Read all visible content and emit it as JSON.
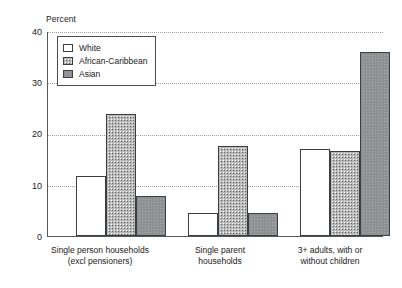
{
  "chart_data": {
    "type": "bar",
    "title": "",
    "subtitle": "",
    "xlabel": "",
    "ylabel": "Percent",
    "ylim": [
      0,
      40
    ],
    "yticks": [
      0,
      10,
      20,
      30,
      40
    ],
    "grid": "horizontal dotted gridlines at 10, 20, 30, 40",
    "legend_position": "inside top-left",
    "categories": [
      "Single person households (excl pensioners)",
      "Single parent households",
      "3+ adults, with or without children"
    ],
    "category_lines": [
      [
        "Single person households",
        "(excl pensioners)"
      ],
      [
        "Single parent",
        "households"
      ],
      [
        "3+ adults, with or",
        "without children"
      ]
    ],
    "series": [
      {
        "name": "White",
        "values": [
          11.7,
          4.5,
          17.0
        ],
        "fill": "white"
      },
      {
        "name": "African-Caribbean",
        "values": [
          23.8,
          17.5,
          16.5
        ],
        "fill": "speckle"
      },
      {
        "name": "Asian",
        "values": [
          7.8,
          4.5,
          36.0
        ],
        "fill": "grey"
      }
    ],
    "annotations": []
  },
  "axis": {
    "ylabel": "Percent",
    "ytick_0": "0",
    "ytick_10": "10",
    "ytick_20": "20",
    "ytick_30": "30",
    "ytick_40": "40"
  },
  "legend": {
    "items": [
      {
        "label": "White"
      },
      {
        "label": "African-Caribbean"
      },
      {
        "label": "Asian"
      }
    ]
  },
  "xaxis": {
    "group1_line1": "Single person households",
    "group1_line2": "(excl pensioners)",
    "group2_line1": "Single parent",
    "group2_line2": "households",
    "group3_line1": "3+ adults, with or",
    "group3_line2": "without children"
  },
  "colors": {
    "axis": "#55595c",
    "grid": "#9aa0a4",
    "bar_outline": "#3b3f42",
    "series_white": "#ffffff",
    "series_african_caribbean": "#b9b9b9",
    "series_asian": "#8e9093",
    "background": "#ffffff",
    "text": "#1a1a1a"
  }
}
